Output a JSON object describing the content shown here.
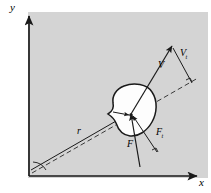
{
  "figure": {
    "background_color": "#ffffff",
    "panel_color": "#d4d4d4",
    "line_color": "#1a1a1a",
    "body_fill": "#fdfdfd"
  },
  "axes": {
    "y_label": "y",
    "x_label": "x",
    "origin_label": ""
  },
  "vectors": {
    "position": {
      "label": "r",
      "sub": ""
    },
    "velocity": {
      "label": "V",
      "sub": ""
    },
    "velocity_component": {
      "label": "V",
      "sub": "t"
    },
    "force": {
      "label": "F",
      "sub": ""
    },
    "force_component": {
      "label": "F",
      "sub": "t"
    }
  },
  "markers": {
    "right_angle_velocity": "right-angle",
    "right_angle_force": "right-angle",
    "origin_angle_arc": "angle-arc"
  }
}
